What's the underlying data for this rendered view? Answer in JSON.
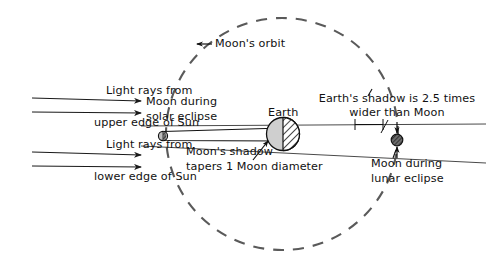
{
  "diagram": {
    "title_visible": false,
    "background_color": "#ffffff",
    "ink_color": "#111111",
    "orbit_color": "#555555",
    "ray_color": "#222222",
    "earth_fill": "#cfcfcf",
    "moon_fill": "#b5b5b5",
    "eclipse_moon_fill": "#4a4a4a"
  },
  "labels": {
    "light_rays_upper_line1": "Light rays from",
    "light_rays_upper_line2": "upper edge of Sun",
    "light_rays_lower_line1": "Light rays from",
    "light_rays_lower_line2": "lower edge of Sun",
    "moon_solar_line1": "Moon during",
    "moon_solar_line2": "solar eclipse",
    "moons_orbit": "Moon's orbit",
    "earth": "Earth",
    "earth_shadow_line1": "Earth's shadow is 2.5 times",
    "earth_shadow_line2": "wider than Moon",
    "moon_shadow_line1": "Moon's shadow",
    "moon_shadow_line2": "tapers 1 Moon diameter",
    "moon_lunar_line1": "Moon during",
    "moon_lunar_line2": "lunar eclipse"
  },
  "objects": {
    "earth": {
      "name": "Earth",
      "cx": 283,
      "cy": 134,
      "r": 16,
      "shaded_side": "right"
    },
    "moon_solar_eclipse": {
      "name": "Moon during solar eclipse",
      "cx": 163,
      "cy": 136,
      "r": 4.5
    },
    "moon_lunar_eclipse": {
      "name": "Moon during lunar eclipse",
      "cx": 397,
      "cy": 140,
      "r": 5.5
    },
    "orbit": {
      "name": "Moon's orbit",
      "cx": 282,
      "cy": 134,
      "r": 116,
      "style": "dashed"
    }
  },
  "annotations": {
    "shadow_ratio": "2.5 times",
    "taper_amount": "1 Moon diameter"
  }
}
